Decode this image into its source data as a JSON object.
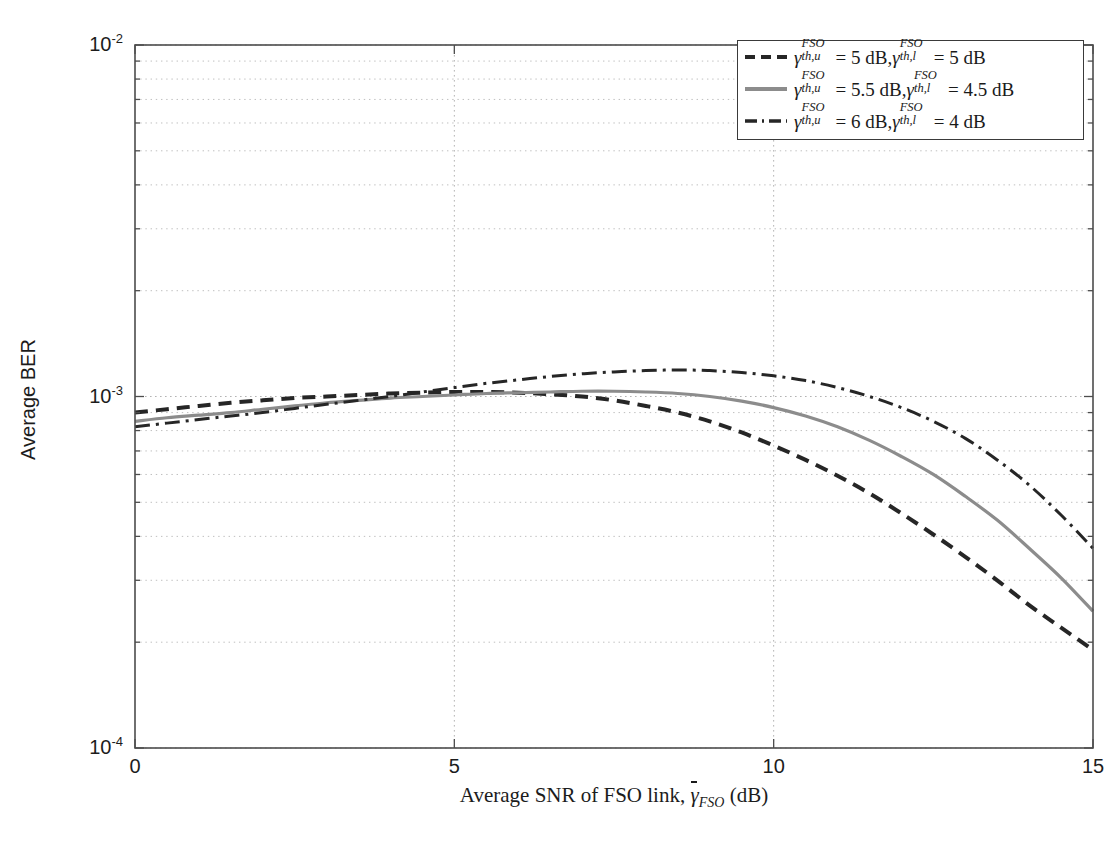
{
  "chart_data": {
    "type": "line",
    "title": "",
    "xlabel": "Average SNR of FSO link, γ̄_FSO (dB)",
    "ylabel": "Average BER",
    "xlim": [
      0,
      15
    ],
    "ylim": [
      0.0001,
      0.01
    ],
    "yscale": "log",
    "grid": true,
    "grid_style": "dotted minor and major",
    "legend_position": "upper right",
    "xticks": [
      "0",
      "5",
      "10",
      "15"
    ],
    "xtick_values": [
      0,
      5,
      10,
      15
    ],
    "yticks": [
      "10^-2",
      "10^-3",
      "10^-4"
    ],
    "ytick_values": [
      0.01,
      0.001,
      0.0001
    ],
    "x": [
      0,
      0.5,
      1,
      1.5,
      2,
      2.5,
      3,
      3.5,
      4,
      4.5,
      5,
      5.5,
      6,
      6.5,
      7,
      7.5,
      8,
      8.5,
      9,
      9.5,
      10,
      10.5,
      11,
      11.5,
      12,
      12.5,
      13,
      13.5,
      14,
      14.5,
      15
    ],
    "series": [
      {
        "name": "gamma_th_u_FSO = 5 dB, gamma_th_l_FSO = 5 dB",
        "label": "γ^FSO_{th,u} = 5 dB, γ^FSO_{th,l} = 5 dB",
        "style": "dashed",
        "color": "#262626",
        "width": 4.0,
        "values": [
          0.0009,
          0.00092,
          0.00094,
          0.00096,
          0.000975,
          0.00099,
          0.001,
          0.00101,
          0.00102,
          0.001025,
          0.00103,
          0.00103,
          0.001025,
          0.001015,
          0.001,
          0.000975,
          0.00094,
          0.0009,
          0.00085,
          0.00079,
          0.000725,
          0.00066,
          0.000595,
          0.00053,
          0.000465,
          0.000405,
          0.00035,
          0.0003,
          0.000255,
          0.00022,
          0.00019
        ]
      },
      {
        "name": "gamma_th_u_FSO = 5.5 dB, gamma_th_l_FSO = 4.5 dB",
        "label": "γ^FSO_{th,u} = 5.5 dB, γ^FSO_{th,l} = 4.5 dB",
        "style": "solid",
        "color": "#8c8c8c",
        "width": 3.2,
        "values": [
          0.00085,
          0.00087,
          0.000885,
          0.0009,
          0.00092,
          0.00094,
          0.00096,
          0.000975,
          0.00099,
          0.001,
          0.00101,
          0.00102,
          0.001025,
          0.00103,
          0.001035,
          0.001035,
          0.00103,
          0.00102,
          0.001,
          0.00097,
          0.00093,
          0.00088,
          0.00082,
          0.00075,
          0.000675,
          0.0006,
          0.00052,
          0.000445,
          0.00037,
          0.000305,
          0.000245
        ]
      },
      {
        "name": "gamma_th_u_FSO = 6 dB, gamma_th_l_FSO = 4 dB",
        "label": "γ^FSO_{th,u} = 6 dB, γ^FSO_{th,l} = 4 dB",
        "style": "dashdot",
        "color": "#262626",
        "width": 3.0,
        "values": [
          0.00082,
          0.00084,
          0.00086,
          0.00088,
          0.0009,
          0.000925,
          0.00095,
          0.000975,
          0.001,
          0.00103,
          0.00106,
          0.00109,
          0.001115,
          0.00114,
          0.00116,
          0.001175,
          0.001185,
          0.00119,
          0.001185,
          0.00117,
          0.001145,
          0.00111,
          0.00106,
          0.001,
          0.00093,
          0.00085,
          0.00076,
          0.00066,
          0.00056,
          0.00046,
          0.00037
        ]
      }
    ]
  },
  "axis": {
    "y_label": "Average BER",
    "x_label_parts": {
      "pre": "Average SNR of FSO link, ",
      "gamma": "γ",
      "gsub": "FSO",
      "post": " (dB)"
    },
    "yticks": [
      {
        "base": "10",
        "exp": "-2"
      },
      {
        "base": "10",
        "exp": "-3"
      },
      {
        "base": "10",
        "exp": "-4"
      }
    ],
    "xticks": [
      "0",
      "5",
      "10",
      "15"
    ]
  },
  "legend": {
    "entries": [
      {
        "key": "dashed",
        "sym": "γ",
        "sup1": "FSO",
        "sub1": "th,u",
        "val1": "5",
        "unit1": "dB",
        "sup2": "FSO",
        "sub2": "th,l",
        "val2": "5",
        "unit2": "dB"
      },
      {
        "key": "solid",
        "sym": "γ",
        "sup1": "FSO",
        "sub1": "th,u",
        "val1": "5.5",
        "unit1": "dB",
        "sup2": "FSO",
        "sub2": "th,l",
        "val2": "4.5",
        "unit2": "dB"
      },
      {
        "key": "dashdot",
        "sym": "γ",
        "sup1": "FSO",
        "sub1": "th,u",
        "val1": "6",
        "unit1": "dB",
        "sup2": "FSO",
        "sub2": "th,l",
        "val2": "4",
        "unit2": "dB"
      }
    ],
    "eq": "=",
    "comma": ","
  },
  "colors": {
    "axis": "#4d4d4d",
    "grid": "#b3b3b3",
    "series_dark": "#262626",
    "series_gray": "#8c8c8c"
  }
}
